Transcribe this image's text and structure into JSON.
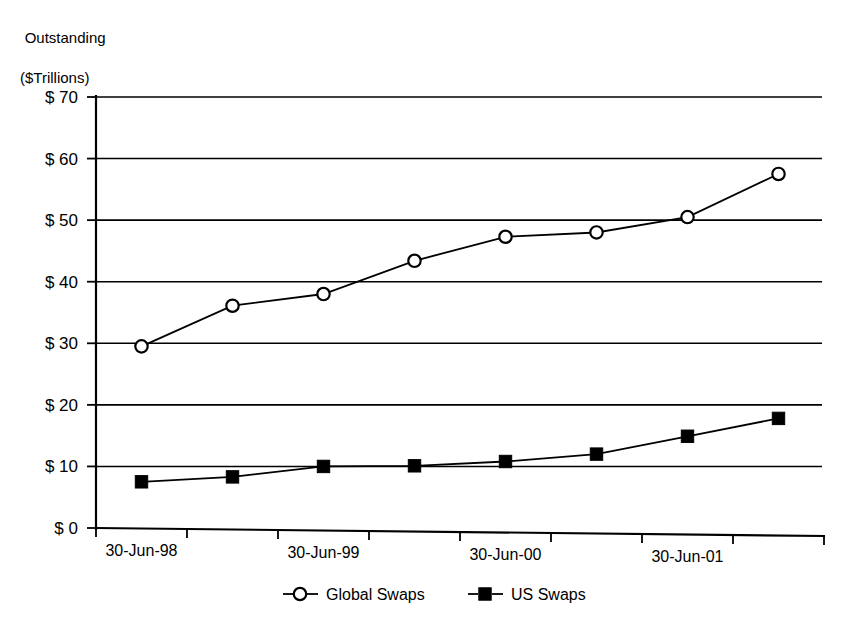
{
  "chart_data": {
    "type": "line",
    "title": "",
    "ylabel_line1": "Outstanding",
    "ylabel_line2": "($Trillions)",
    "xlabel": "",
    "ylim": [
      0,
      70
    ],
    "yticks": [
      0,
      10,
      20,
      30,
      40,
      50,
      60,
      70
    ],
    "ytick_labels": [
      "$  0",
      "$ 10",
      "$ 20",
      "$ 30",
      "$ 40",
      "$ 50",
      "$ 60",
      "$ 70"
    ],
    "grid": true,
    "legend_position": "bottom",
    "x": [
      "30-Jun-98",
      "31-Dec-98",
      "30-Jun-99",
      "31-Dec-99",
      "30-Jun-00",
      "31-Dec-00",
      "30-Jun-01",
      "31-Dec-01"
    ],
    "xtick_labels": [
      "30-Jun-98",
      "",
      "30-Jun-99",
      "",
      "30-Jun-00",
      "",
      "30-Jun-01",
      ""
    ],
    "series": [
      {
        "name": "Global Swaps",
        "marker": "open-circle",
        "values": [
          29.5,
          36.1,
          38.0,
          43.4,
          47.3,
          48.0,
          50.5,
          57.5
        ]
      },
      {
        "name": "US Swaps",
        "marker": "filled-square",
        "values": [
          7.5,
          8.3,
          10.0,
          10.1,
          10.8,
          12.0,
          14.9,
          17.8
        ]
      }
    ],
    "colors": {
      "ink": "#000000",
      "background": "#ffffff"
    }
  }
}
